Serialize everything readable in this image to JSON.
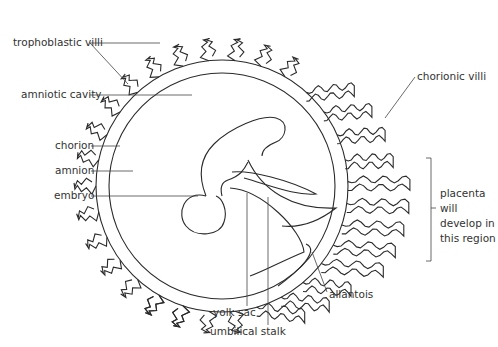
{
  "diagram": {
    "type": "anatomical-cross-section"
  },
  "labels": {
    "trophoblastic_villi": "trophoblastic villi",
    "amniotic_cavity": "amniotic cavity",
    "chorion": "chorion",
    "amnion": "amnion",
    "embryo": "embryo",
    "chorionic_villi": "chorionic villi",
    "placenta_region": "placenta\nwill\ndevelop in\nthis region",
    "allantois": "allantois",
    "yolk_sac": "yolk sac",
    "umbilical_stalk": "umbilical stalk"
  },
  "colors": {
    "line": "#2a2a2a",
    "text": "#333333",
    "background": "#ffffff"
  }
}
